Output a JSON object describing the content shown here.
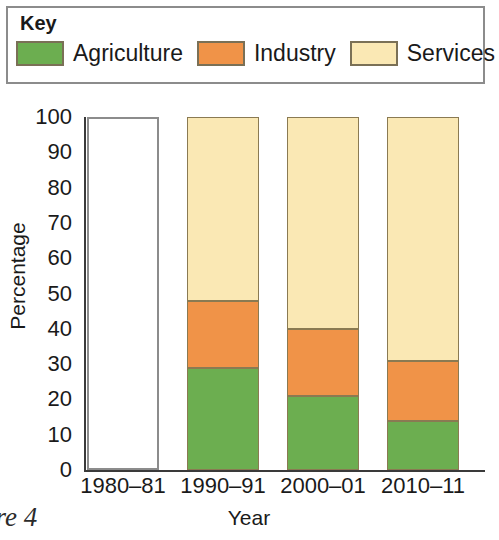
{
  "legend": {
    "title": "Key",
    "items": [
      {
        "label": "Agriculture",
        "color": "#6CAE50",
        "icon": "legend-swatch-icon"
      },
      {
        "label": "Industry",
        "color": "#F09348",
        "icon": "legend-swatch-icon"
      },
      {
        "label": "Services",
        "color": "#FAE8B4",
        "icon": "legend-swatch-icon"
      }
    ]
  },
  "figure_caption": "ure 4",
  "chart_data": {
    "type": "bar",
    "stacked": true,
    "title": "",
    "xlabel": "Year",
    "ylabel": "Percentage",
    "ylim": [
      0,
      100
    ],
    "yticks": [
      0,
      10,
      20,
      30,
      40,
      50,
      60,
      70,
      80,
      90,
      100
    ],
    "ytick_labels": [
      "0",
      "10",
      "20",
      "30",
      "40",
      "50",
      "60",
      "70",
      "80",
      "90",
      "100"
    ],
    "grid": false,
    "legend_position": "top",
    "categories": [
      "1980–81",
      "1990–91",
      "2000–01",
      "2010–11"
    ],
    "series": [
      {
        "name": "Agriculture",
        "color": "#6CAE50",
        "values": [
          null,
          29,
          21,
          14
        ]
      },
      {
        "name": "Industry",
        "color": "#F09348",
        "values": [
          null,
          19,
          19,
          17
        ]
      },
      {
        "name": "Services",
        "color": "#FAE8B4",
        "values": [
          null,
          52,
          60,
          69
        ]
      }
    ],
    "bars": [
      {
        "category": "1980–81",
        "empty": true,
        "segments": []
      },
      {
        "category": "1990–91",
        "empty": false,
        "segments": [
          {
            "name": "Agriculture",
            "color": "#6CAE50",
            "start": 0,
            "end": 29
          },
          {
            "name": "Industry",
            "color": "#F09348",
            "start": 29,
            "end": 48
          },
          {
            "name": "Services",
            "color": "#FAE8B4",
            "start": 48,
            "end": 100
          }
        ]
      },
      {
        "category": "2000–01",
        "empty": false,
        "segments": [
          {
            "name": "Agriculture",
            "color": "#6CAE50",
            "start": 0,
            "end": 21
          },
          {
            "name": "Industry",
            "color": "#F09348",
            "start": 21,
            "end": 40
          },
          {
            "name": "Services",
            "color": "#FAE8B4",
            "start": 40,
            "end": 100
          }
        ]
      },
      {
        "category": "2010–11",
        "empty": false,
        "segments": [
          {
            "name": "Agriculture",
            "color": "#6CAE50",
            "start": 0,
            "end": 14
          },
          {
            "name": "Industry",
            "color": "#F09348",
            "start": 14,
            "end": 31
          },
          {
            "name": "Services",
            "color": "#FAE8B4",
            "start": 31,
            "end": 100
          }
        ]
      }
    ]
  }
}
